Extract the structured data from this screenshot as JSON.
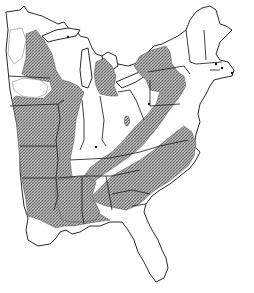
{
  "figure": {
    "type": "range-map",
    "region": "Eastern United States",
    "style": "black-and-white line map with stippled/hatched shading",
    "colors": {
      "background": "#ffffff",
      "outline": "#2a2a2a",
      "shading": "#8a8a8a"
    },
    "legend": {
      "shaded_area": "range (hatched)",
      "dot": "isolated record"
    },
    "markers": [
      {
        "id": "upper-michigan",
        "x": 68,
        "y": 37
      },
      {
        "id": "new-hampshire-mass",
        "x": 216,
        "y": 64
      },
      {
        "id": "massachusetts-east",
        "x": 222,
        "y": 68
      },
      {
        "id": "cape-cod",
        "x": 232,
        "y": 73
      },
      {
        "id": "western-pennsylvania",
        "x": 149,
        "y": 104
      },
      {
        "id": "kentucky",
        "x": 96,
        "y": 147
      }
    ],
    "isolated_patch": {
      "id": "ohio-patch",
      "x": 127,
      "y": 121
    }
  }
}
